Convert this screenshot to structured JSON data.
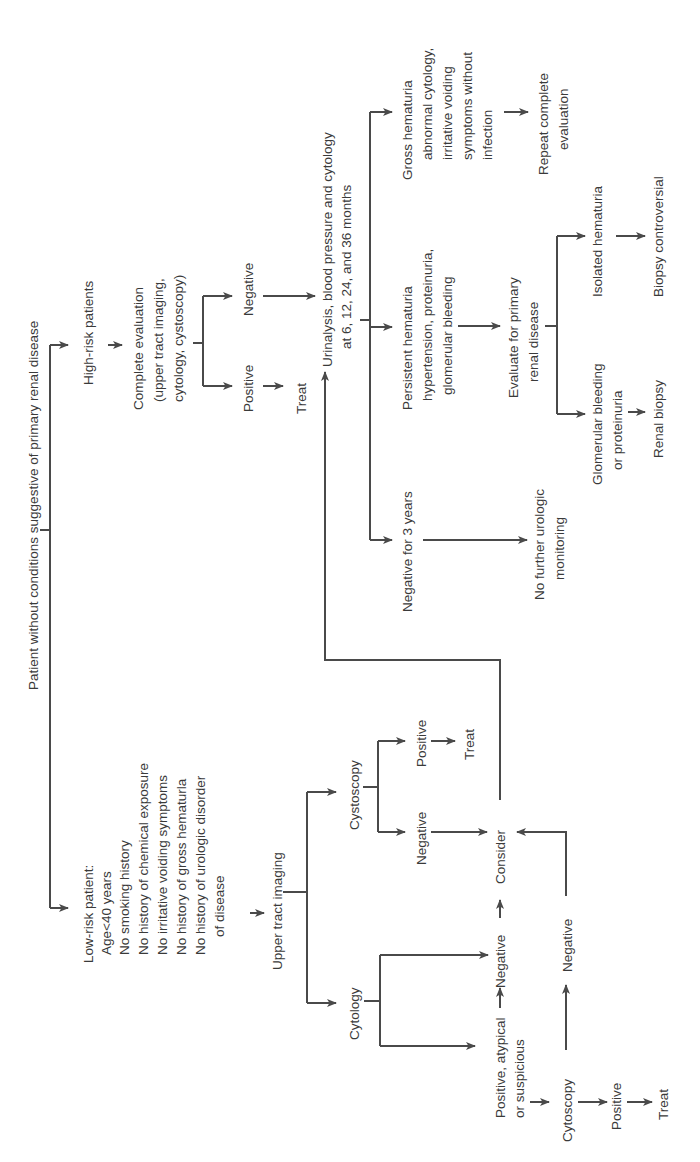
{
  "figure": {
    "orientation": "rotated-90-ccw",
    "line_color": "#4a4a4a",
    "text_color": "#3a3a3a",
    "root": "Patient without conditions suggestive of primary renal disease",
    "high_risk": {
      "label": "High-risk patients",
      "complete_eval": [
        "Complete evaluation",
        "(upper tract imaging,",
        "cytology, cystoscopy)"
      ],
      "positive": "Positive",
      "treat": "Treat",
      "negative": "Negative"
    },
    "followup": {
      "label": [
        "Urinalysis, blood pressure and cytology",
        "at 6, 12, 24, and 36 months"
      ],
      "negative_3y": "Negative for 3 years",
      "no_further": [
        "No further urologic",
        "monitoring"
      ],
      "persistent": [
        "Persistent hematuria",
        "hypertension, proteinuria,",
        "glomerular bleeding"
      ],
      "evaluate_renal": [
        "Evaluate for primary",
        "renal disease"
      ],
      "glomerular": [
        "Glomerular bleeding",
        "or proteinuria"
      ],
      "renal_biopsy": "Renal biopsy",
      "isolated": "Isolated hematuria",
      "biopsy_controversial": "Biopsy controversial",
      "gross": [
        "Gross hematuria",
        "abnormal cytology,",
        "irritative voiding",
        "symptoms without",
        "infection"
      ],
      "repeat": [
        "Repeat complete",
        "evaluation"
      ]
    },
    "low_risk": {
      "label": [
        "Low-risk patient:",
        "Age<40 years",
        "No smoking history",
        "No history of chemical exposure",
        "No irritative voiding symptoms",
        "No history of gross hematurla",
        "No history of urologic disorder",
        "of disease"
      ],
      "upper_tract": "Upper tract imaging",
      "cytology": "Cytology",
      "cytology_positive": [
        "Positive, atypical",
        "or suspicious"
      ],
      "cytology_negative": "Negative",
      "cystoscopy": "Cystoscopy",
      "cysto_negative": "Negative",
      "cysto_positive": "Positive",
      "cysto_treat": "Treat",
      "consider": "Consider",
      "cytoscopy2": "Cytoscopy",
      "cytoscopy2_negative": "Negative",
      "cytoscopy2_positive": "Positive",
      "cytoscopy2_treat": "Treat"
    }
  }
}
